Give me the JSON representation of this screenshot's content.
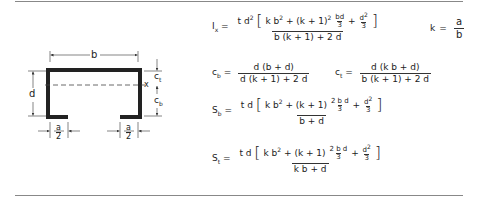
{
  "diagram": {
    "labels": {
      "b": "b",
      "d": "d",
      "x": "x",
      "ct": "c",
      "ct_sub": "t",
      "cb": "c",
      "cb_sub": "b",
      "a_num": "a",
      "a_den": "2"
    }
  },
  "formulas": {
    "ix": {
      "label": "I",
      "label_sub": "x",
      "eq": "=",
      "num_prefix": "t d",
      "num_prefix_sup": "2",
      "bracket_open": "[",
      "term1": "k b",
      "term1_sup": "2",
      "plus1": "+ (k + 1)",
      "plus1_sup": "2",
      "frac1_num": "bd",
      "frac1_den": "3",
      "plus2": "+",
      "frac2_num": "d",
      "frac2_num_sup": "2",
      "frac2_den": "3",
      "bracket_close": "]",
      "den": "b (k + 1) + 2 d"
    },
    "k": {
      "label": "k",
      "eq": "=",
      "num": "a",
      "den": "b"
    },
    "cb": {
      "label": "c",
      "label_sub": "b",
      "eq": "=",
      "num": "d (b + d)",
      "den": "d (k + 1) + 2 d"
    },
    "ct": {
      "label": "c",
      "label_sub": "t",
      "eq": "=",
      "num": "d (k b + d)",
      "den": "b (k + 1) + 2 d"
    },
    "sb": {
      "label": "S",
      "label_sub": "b",
      "eq": "=",
      "num_prefix": "t d",
      "bracket_open": "[",
      "term1": "k b",
      "term1_sup": "2",
      "plus1": "+ (k + 1)",
      "frac1_num": "2 b d",
      "frac1_den": "3",
      "plus2": "+",
      "frac2_num": "d",
      "frac2_num_sup": "2",
      "frac2_den": "3",
      "bracket_close": "]",
      "den": "b + d"
    },
    "st": {
      "label": "S",
      "label_sub": "t",
      "eq": "=",
      "num_prefix": "t d",
      "bracket_open": "[",
      "term1": "k b",
      "term1_sup": "2",
      "plus1": "+ (k + 1)",
      "frac1_num": "2 b d",
      "frac1_den": "3",
      "plus2": "+",
      "frac2_num": "d",
      "frac2_num_sup": "2",
      "frac2_den": "3",
      "bracket_close": "]",
      "den": "k b + d"
    }
  }
}
